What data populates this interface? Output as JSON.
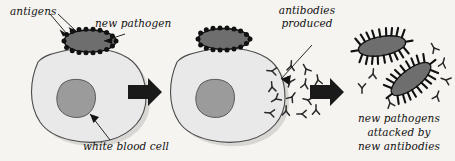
{
  "diagram": {
    "background_color": "#f6f4f0",
    "ink_color": "#111111",
    "labels": {
      "antigens": "antigens",
      "new_pathogen": "new pathogen",
      "antibodies_produced_line1": "antibodies",
      "antibodies_produced_line2": "produced",
      "white_blood_cell": "white blood cell",
      "result_line1": "new pathogens",
      "result_line2": "attacked by",
      "result_line3": "new antibodies"
    },
    "colors": {
      "cell_fill": "#e9e9e9",
      "cell_outline": "#4a4a4a",
      "nucleus_fill": "#9b9b9b",
      "nucleus_outline": "#5a5a5a",
      "pathogen_body": "#6e6e6e",
      "antigen_spike": "#111111",
      "arrow_black": "#1a1a1a",
      "antibody": "#2a2a2a",
      "shadow": "#cfcdc9"
    },
    "stages": [
      {
        "index": 1,
        "name": "pathogen-binds-white-blood-cell",
        "elements": [
          "white blood cell",
          "nucleus",
          "new pathogen with antigens"
        ]
      },
      {
        "index": 2,
        "name": "antibodies-produced",
        "elements": [
          "white blood cell",
          "nucleus",
          "pathogen",
          "antibody cluster"
        ],
        "antibody_count": 14
      },
      {
        "index": 3,
        "name": "pathogens-attacked",
        "elements": [
          "two spiked pathogens",
          "free antibodies"
        ],
        "pathogen_count": 2,
        "antibody_count": 7
      }
    ],
    "arrows": [
      {
        "name": "stage-1-to-2",
        "direction": "right"
      },
      {
        "name": "stage-2-to-3",
        "direction": "right"
      }
    ]
  }
}
